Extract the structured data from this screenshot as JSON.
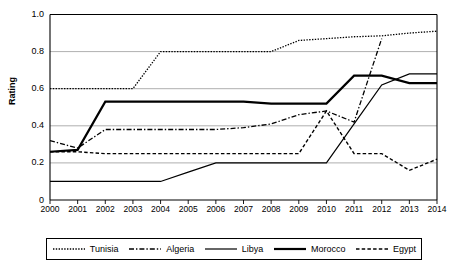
{
  "chart_data": {
    "type": "line",
    "title": "",
    "xlabel": "",
    "ylabel": "Rating",
    "xlim": [
      2000,
      2014
    ],
    "ylim": [
      0,
      1.0
    ],
    "grid": true,
    "legend_position": "bottom",
    "x": [
      2000,
      2001,
      2002,
      2003,
      2004,
      2005,
      2006,
      2007,
      2008,
      2009,
      2010,
      2011,
      2012,
      2013,
      2014
    ],
    "xtick_labels": [
      "2000",
      "2001",
      "2002",
      "2003",
      "2004",
      "2005",
      "2006",
      "2007",
      "2008",
      "2009",
      "2010",
      "2011",
      "2012",
      "2013",
      "2014"
    ],
    "ytick_labels": [
      "0",
      "0.2",
      "0.4",
      "0.6",
      "0.8",
      "1.0"
    ],
    "ytick_values": [
      0,
      0.2,
      0.4,
      0.6,
      0.8,
      1.0
    ],
    "series": [
      {
        "name": "Tunisia",
        "style": "dotted",
        "color": "#000000",
        "width": 1.3,
        "values": [
          0.6,
          0.6,
          0.6,
          0.6,
          0.8,
          0.8,
          0.8,
          0.8,
          0.8,
          0.86,
          0.87,
          0.88,
          0.885,
          0.9,
          0.91
        ]
      },
      {
        "name": "Algeria",
        "style": "dashdot",
        "color": "#000000",
        "width": 1.3,
        "values": [
          0.32,
          0.28,
          0.38,
          0.38,
          0.38,
          0.38,
          0.38,
          0.39,
          0.41,
          0.46,
          0.48,
          0.42,
          0.87,
          null,
          null
        ]
      },
      {
        "name": "Libya",
        "style": "solid-thin",
        "color": "#000000",
        "width": 1.2,
        "values": [
          0.1,
          0.1,
          0.1,
          0.1,
          0.1,
          0.15,
          0.2,
          0.2,
          0.2,
          0.2,
          0.2,
          0.41,
          0.62,
          0.68,
          0.68
        ]
      },
      {
        "name": "Morocco",
        "style": "solid-thick",
        "color": "#000000",
        "width": 2.2,
        "values": [
          0.26,
          0.27,
          0.53,
          0.53,
          0.53,
          0.53,
          0.53,
          0.53,
          0.52,
          0.52,
          0.52,
          0.67,
          0.67,
          0.63,
          0.63
        ]
      },
      {
        "name": "Egypt",
        "style": "dashed",
        "color": "#000000",
        "width": 1.4,
        "values": [
          0.26,
          0.26,
          0.25,
          0.25,
          0.25,
          0.25,
          0.25,
          0.25,
          0.25,
          0.25,
          0.48,
          0.25,
          0.25,
          0.16,
          0.22
        ]
      }
    ]
  },
  "legend": {
    "items": [
      {
        "label": "Tunisia",
        "style": "dotted"
      },
      {
        "label": "Algeria",
        "style": "dashdot"
      },
      {
        "label": "Libya",
        "style": "solid-thin"
      },
      {
        "label": "Morocco",
        "style": "solid-thick"
      },
      {
        "label": "Egypt",
        "style": "dashed"
      }
    ]
  }
}
